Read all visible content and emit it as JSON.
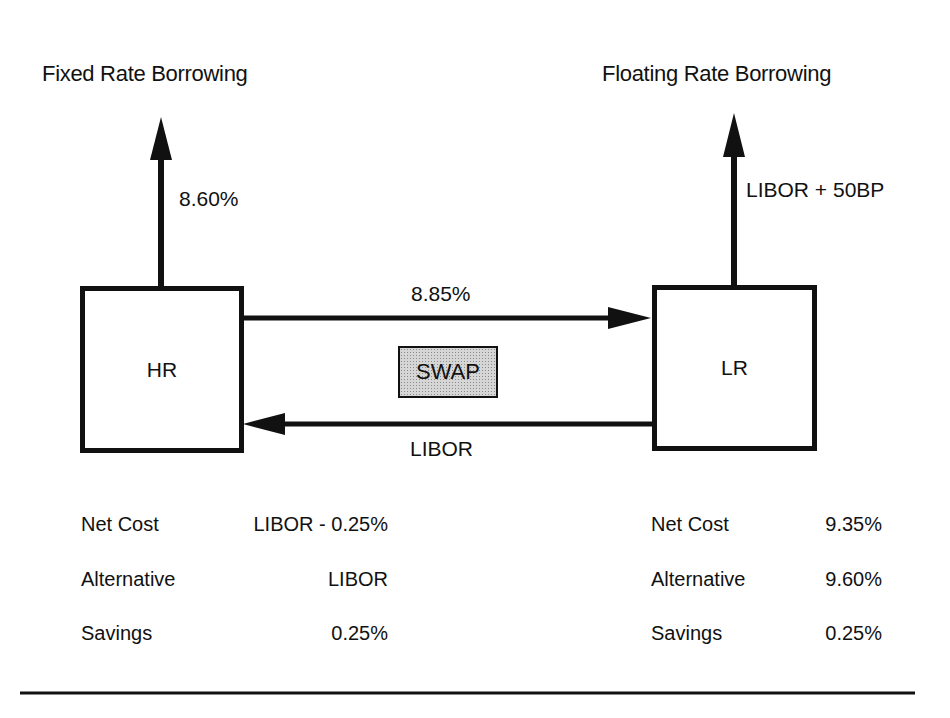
{
  "diagram": {
    "left_heading": "Fixed Rate Borrowing",
    "right_heading": "Floating Rate Borrowing",
    "left_party": {
      "name": "HR",
      "borrowing_rate": "8.60%"
    },
    "right_party": {
      "name": "LR",
      "borrowing_rate": "LIBOR + 50BP"
    },
    "swap_label": "SWAP",
    "flows": [
      {
        "from": "HR",
        "to": "LR",
        "label": "8.85%"
      },
      {
        "from": "LR",
        "to": "HR",
        "label": "LIBOR"
      }
    ],
    "colors": {
      "ink": "#111111",
      "swap_fill": "#d6d6d6",
      "background": "#ffffff"
    }
  },
  "summary": {
    "left": [
      {
        "label": "Net Cost",
        "value": "LIBOR - 0.25%"
      },
      {
        "label": "Alternative",
        "value": "LIBOR"
      },
      {
        "label": "Savings",
        "value": "0.25%"
      }
    ],
    "right": [
      {
        "label": "Net Cost",
        "value": "9.35%"
      },
      {
        "label": "Alternative",
        "value": "9.60%"
      },
      {
        "label": "Savings",
        "value": "0.25%"
      }
    ]
  }
}
